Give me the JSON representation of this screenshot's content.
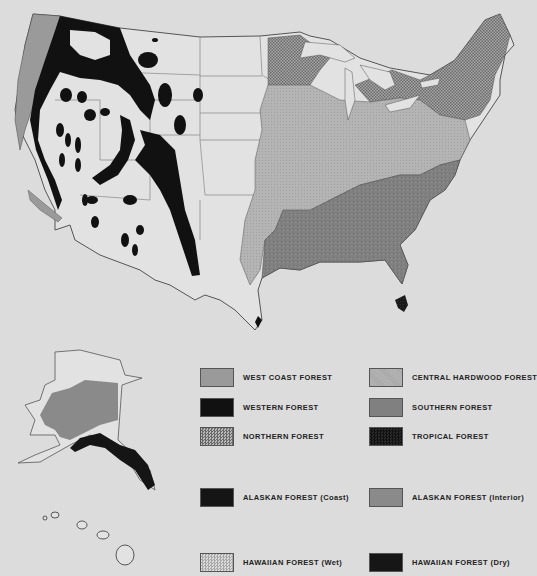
{
  "colors": {
    "background": "#dcdcdc",
    "land": "#e2e2e2",
    "west_coast": "#9a9a9a",
    "western": "#111111",
    "northern": "#8e8e8e",
    "central_hardwood": "#b2b2b2",
    "southern": "#7c7c7c",
    "tropical": "#1e1e1e",
    "alaskan_coast": "#151515",
    "alaskan_interior": "#8a8a8a",
    "hawaiian_wet": "#d0d0d0",
    "hawaiian_dry": "#161616",
    "border": "#555555"
  },
  "legend": {
    "items": [
      {
        "label": "WEST COAST FOREST",
        "pattern": "solid-mid-gray"
      },
      {
        "label": "CENTRAL HARDWOOD FOREST",
        "pattern": "dotted-light-gray"
      },
      {
        "label": "WESTERN FOREST",
        "pattern": "solid-black"
      },
      {
        "label": "SOUTHERN FOREST",
        "pattern": "mottled-dark-gray"
      },
      {
        "label": "NORTHERN FOREST",
        "pattern": "crosshatch-gray"
      },
      {
        "label": "TROPICAL FOREST",
        "pattern": "dotted-black"
      },
      {
        "label": "ALASKAN FOREST (Coast)",
        "pattern": "solid-black"
      },
      {
        "label": "ALASKAN FOREST (Interior)",
        "pattern": "solid-mid-gray"
      },
      {
        "label": "HAWAIIAN FOREST (Wet)",
        "pattern": "dotted-very-light"
      },
      {
        "label": "HAWAIIAN FOREST (Dry)",
        "pattern": "solid-black"
      }
    ]
  },
  "map": {
    "regions": [
      "Contiguous United States",
      "Alaska",
      "Hawaii"
    ]
  }
}
